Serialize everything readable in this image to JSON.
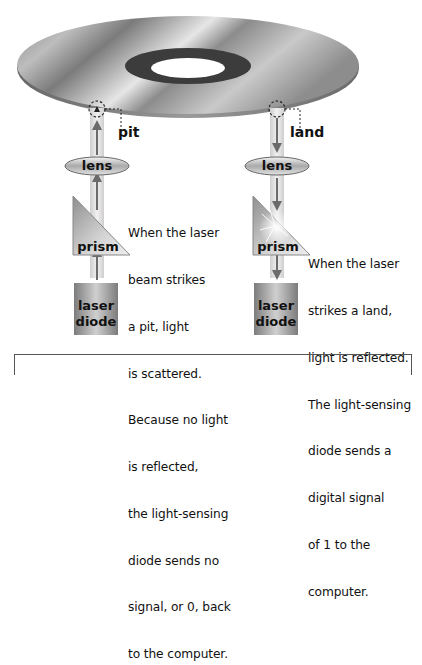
{
  "figure": {
    "disc": {
      "name": "compact disc"
    },
    "left": {
      "callout": "pit",
      "beam_direction": "up",
      "lens_label": "lens",
      "prism_label": "prism",
      "diode_label_1": "laser",
      "diode_label_2": "diode",
      "caption_lines": [
        "When the laser",
        "beam strikes",
        "a pit, light",
        "is scattered.",
        "Because no light",
        "is reflected,",
        "the light-sensing",
        "diode sends no",
        "signal, or 0, back",
        "to the computer."
      ]
    },
    "right": {
      "callout": "land",
      "beam_direction": "down",
      "lens_label": "lens",
      "prism_label": "prism",
      "diode_label_1": "laser",
      "diode_label_2": "diode",
      "caption_lines": [
        "When the laser",
        "strikes a land,",
        "light is reflected.",
        "The light-sensing",
        "diode sends a",
        "digital signal",
        "of 1 to the",
        "computer."
      ]
    },
    "colors": {
      "beam": "#e3e1e1",
      "arrow": "#6b6b6b",
      "disc_dark": "#6f6f6f",
      "disc_light": "#d9d9d9"
    }
  }
}
